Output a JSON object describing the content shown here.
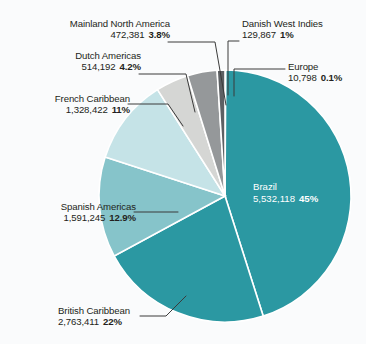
{
  "chart_data": {
    "type": "pie",
    "title": "",
    "subtitle": "",
    "xlabel": "",
    "ylabel": "",
    "legend_position": "none",
    "grid": false,
    "label_format": "name, value, percent",
    "total": 12332414,
    "categories": [
      "Brazil",
      "British Caribbean",
      "Spanish Americas",
      "French Caribbean",
      "Dutch Americas",
      "Mainland North America",
      "Danish West Indies",
      "Europe"
    ],
    "values": [
      5532118,
      2763411,
      1591245,
      1328422,
      514192,
      472381,
      129867,
      10798
    ],
    "percents": [
      45,
      22,
      12.9,
      11,
      4.2,
      3.8,
      1,
      0.1
    ],
    "percent_labels": [
      "45%",
      "22%",
      "12.9%",
      "11%",
      "4.2%",
      "3.8%",
      "1%",
      "0.1%"
    ],
    "value_labels": [
      "5,532,118",
      "2,763,411",
      "1,591,245",
      "1,328,422",
      "514,192",
      "472,381",
      "129,867",
      "10,798"
    ],
    "colors": [
      "#2b98a2",
      "#2b98a2",
      "#86c4ca",
      "#c5e3e7",
      "#d5d6d4",
      "#95989a",
      "#5d6063",
      "#27333f"
    ],
    "slices": [
      {
        "name": "Brazil",
        "value": "5,532,118",
        "percent": "45%",
        "color": "#2b98a2"
      },
      {
        "name": "British Caribbean",
        "value": "2,763,411",
        "percent": "22%",
        "color": "#2b98a2"
      },
      {
        "name": "Spanish Americas",
        "value": "1,591,245",
        "percent": "12.9%",
        "color": "#86c4ca"
      },
      {
        "name": "French Caribbean",
        "value": "1,328,422",
        "percent": "11%",
        "color": "#c5e3e7"
      },
      {
        "name": "Dutch Americas",
        "value": "514,192",
        "percent": "4.2%",
        "color": "#d5d6d4"
      },
      {
        "name": "Mainland North America",
        "value": "472,381",
        "percent": "3.8%",
        "color": "#95989a"
      },
      {
        "name": "Danish West Indies",
        "value": "129,867",
        "percent": "1%",
        "color": "#5d6063"
      },
      {
        "name": "Europe",
        "value": "10,798",
        "percent": "0.1%",
        "color": "#27333f"
      }
    ]
  },
  "labels": {
    "mainland_north_america": {
      "name": "Mainland North America",
      "value": "472,381",
      "percent": "3.8%"
    },
    "dutch_americas": {
      "name": "Dutch Americas",
      "value": "514,192",
      "percent": "4.2%"
    },
    "french_caribbean": {
      "name": "French Caribbean",
      "value": "1,328,422",
      "percent": "11%"
    },
    "spanish_americas": {
      "name": "Spanish Americas",
      "value": "1,591,245",
      "percent": "12.9%"
    },
    "british_caribbean": {
      "name": "British Caribbean",
      "value": "2,763,411",
      "percent": "22%"
    },
    "danish_west_indies": {
      "name": "Danish West Indies",
      "value": "129,867",
      "percent": "1%"
    },
    "europe": {
      "name": "Europe",
      "value": "10,798",
      "percent": "0.1%"
    },
    "brazil": {
      "name": "Brazil",
      "value": "5,532,118",
      "percent": "45%"
    }
  },
  "style": {
    "background": "#fafbfc",
    "text_color": "#231f20",
    "inner_text_color": "#ffffff",
    "leader_line_color": "#3b3b3b",
    "slice_gap_color": "#ffffff"
  }
}
